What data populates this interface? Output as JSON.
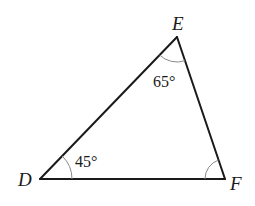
{
  "diagram": {
    "type": "triangle",
    "vertices": [
      {
        "label": "D",
        "x": 40,
        "y": 179
      },
      {
        "label": "E",
        "x": 177,
        "y": 37
      },
      {
        "label": "F",
        "x": 225,
        "y": 179
      }
    ],
    "angles": [
      {
        "vertex": "D",
        "label": "45°"
      },
      {
        "vertex": "E",
        "label": "65°"
      },
      {
        "vertex": "F",
        "label": ""
      }
    ],
    "colors": {
      "line": "#1a1a1a",
      "arc": "#8a8a8a"
    }
  }
}
